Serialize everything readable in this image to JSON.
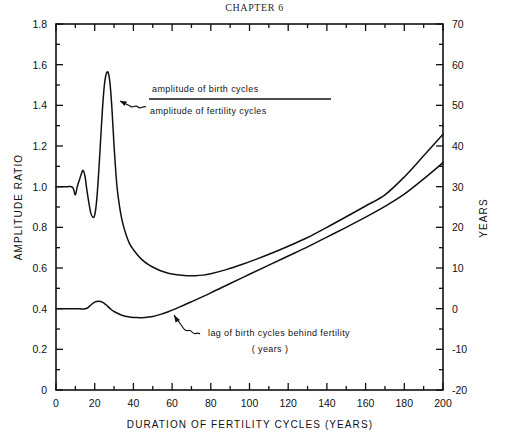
{
  "page": {
    "chapter_heading": "CHAPTER 6"
  },
  "chart_data": {
    "type": "line",
    "title": "CHAPTER 6",
    "xlabel": "DURATION OF FERTILITY CYCLES (YEARS)",
    "ylabel": "AMPLITUDE  RATIO",
    "y2label": "YEARS",
    "xlim": [
      0,
      200
    ],
    "ylim": [
      0,
      1.8
    ],
    "y2lim": [
      -20,
      70
    ],
    "grid": false,
    "legend": "annotations",
    "xticks": [
      "0",
      "20",
      "40",
      "60",
      "80",
      "100",
      "120",
      "140",
      "160",
      "180",
      "200"
    ],
    "xtick_values": [
      0,
      20,
      40,
      60,
      80,
      100,
      120,
      140,
      160,
      180,
      200
    ],
    "xminor_step": 10,
    "yticks": [
      "0",
      "0.2",
      "0.4",
      "0.6",
      "0.8",
      "1.0",
      "1.2",
      "1.4",
      "1.6",
      "1.8"
    ],
    "ytick_values": [
      0,
      0.2,
      0.4,
      0.6,
      0.8,
      1.0,
      1.2,
      1.4,
      1.6,
      1.8
    ],
    "yminor_step": 0.1,
    "y2ticks": [
      "-20",
      "-10",
      "0",
      "10",
      "20",
      "30",
      "40",
      "50",
      "60",
      "70"
    ],
    "y2tick_values": [
      -20,
      -10,
      0,
      10,
      20,
      30,
      40,
      50,
      60,
      70
    ],
    "y2minor_step": 5,
    "series": [
      {
        "name": "amplitude of birth cycles / amplitude of fertility cycles",
        "axis": "left",
        "x": [
          0,
          2,
          4,
          6,
          8,
          9,
          10,
          11,
          12,
          13,
          14,
          15,
          16,
          17,
          18,
          19,
          20,
          21,
          22,
          23,
          24,
          25,
          26,
          27,
          28,
          29,
          30,
          31,
          32,
          34,
          36,
          38,
          40,
          44,
          48,
          52,
          56,
          60,
          64,
          68,
          72,
          76,
          80,
          88,
          96,
          104,
          112,
          120,
          130,
          140,
          150,
          160,
          170,
          180,
          190,
          200
        ],
        "y": [
          1.0,
          1.0,
          1.0,
          1.0,
          1.0,
          0.99,
          0.96,
          1.0,
          1.03,
          1.06,
          1.08,
          1.05,
          0.98,
          0.92,
          0.87,
          0.85,
          0.86,
          0.93,
          1.06,
          1.22,
          1.38,
          1.5,
          1.555,
          1.56,
          1.5,
          1.37,
          1.2,
          1.06,
          0.96,
          0.84,
          0.77,
          0.72,
          0.69,
          0.645,
          0.615,
          0.595,
          0.58,
          0.57,
          0.565,
          0.562,
          0.562,
          0.565,
          0.572,
          0.592,
          0.617,
          0.645,
          0.675,
          0.707,
          0.75,
          0.8,
          0.852,
          0.905,
          0.96,
          1.048,
          1.152,
          1.258
        ]
      },
      {
        "name": "lag of birth cycles behind fertility (years)",
        "axis": "right",
        "x": [
          0,
          4,
          8,
          12,
          14,
          16,
          18,
          20,
          22,
          24,
          26,
          28,
          30,
          34,
          38,
          42,
          46,
          50,
          54,
          58,
          62,
          66,
          70,
          80,
          90,
          100,
          110,
          120,
          130,
          140,
          150,
          160,
          170,
          180,
          190,
          200
        ],
        "y_ratio": [
          0.4,
          0.4,
          0.4,
          0.4,
          0.398,
          0.402,
          0.418,
          0.432,
          0.437,
          0.432,
          0.418,
          0.4,
          0.386,
          0.368,
          0.359,
          0.356,
          0.357,
          0.362,
          0.372,
          0.385,
          0.4,
          0.417,
          0.434,
          0.478,
          0.524,
          0.569,
          0.614,
          0.659,
          0.704,
          0.752,
          0.8,
          0.85,
          0.903,
          0.963,
          1.038,
          1.118
        ],
        "y_years": [
          0,
          0,
          0,
          0,
          -0.1,
          0.1,
          0.9,
          1.6,
          1.85,
          1.6,
          0.9,
          0,
          -0.7,
          -1.6,
          -2.05,
          -2.2,
          -2.15,
          -1.9,
          -1.4,
          -0.75,
          0,
          0.85,
          1.7,
          3.9,
          6.2,
          8.45,
          10.7,
          12.95,
          15.2,
          17.6,
          20,
          22.5,
          25.15,
          28.15,
          31.9,
          35.9
        ]
      }
    ],
    "annotations": [
      {
        "name": "amplitude-ratio-fraction",
        "numerator": "amplitude of birth cycles",
        "denominator": "amplitude of fertility cycles"
      },
      {
        "name": "lag-label",
        "line1": "lag of birth cycles behind fertility",
        "line2": "( years )"
      }
    ]
  }
}
